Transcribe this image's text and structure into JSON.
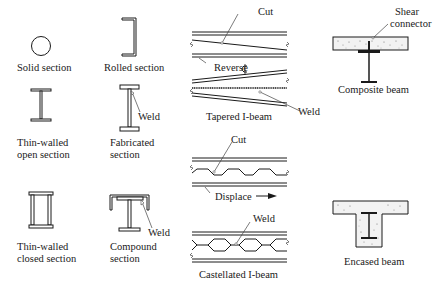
{
  "figure": {
    "sections": [
      {
        "id": "solid",
        "label_lines": [
          "Solid section"
        ]
      },
      {
        "id": "rolled",
        "label_lines": [
          "Rolled section"
        ]
      },
      {
        "id": "thin-open",
        "label_lines": [
          "Thin-walled",
          "open section"
        ]
      },
      {
        "id": "fabricated",
        "label_lines": [
          "Fabricated",
          "section"
        ],
        "callout": "Weld"
      },
      {
        "id": "thin-closed",
        "label_lines": [
          "Thin-walled",
          "closed section"
        ]
      },
      {
        "id": "compound",
        "label_lines": [
          "Compound",
          "section"
        ],
        "callout": "Weld"
      }
    ],
    "tapered": {
      "label": "Tapered I-beam",
      "cut": "Cut",
      "reverse": "Reverse",
      "weld": "Weld"
    },
    "castellated": {
      "label": "Castellated I-beam",
      "cut": "Cut",
      "displace": "Displace",
      "weld": "Weld"
    },
    "composite": {
      "label": "Composite beam",
      "connector_line1": "Shear",
      "connector_line2": "connector"
    },
    "encased": {
      "label": "Encased beam"
    },
    "colors": {
      "ink": "#1a1a1a",
      "concrete": "#f2f2f2",
      "background": "#ffffff"
    }
  }
}
